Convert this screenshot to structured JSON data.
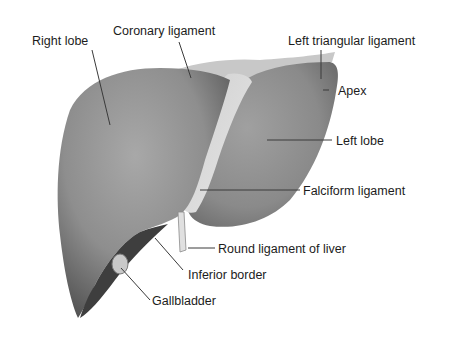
{
  "diagram": {
    "colors": {
      "background": "#ffffff",
      "organ_dark": "#6a6a6a",
      "organ_mid": "#8c8c8c",
      "organ_light": "#a9a9a9",
      "ligament": "#d8d8d8",
      "leader_line": "#3a3a3a",
      "text": "#1c1c1c"
    },
    "labels": [
      {
        "id": "right-lobe",
        "text": "Right lobe"
      },
      {
        "id": "coronary-ligament",
        "text": "Coronary ligament"
      },
      {
        "id": "left-triangular-ligament",
        "text": "Left triangular ligament"
      },
      {
        "id": "apex",
        "text": "Apex"
      },
      {
        "id": "left-lobe",
        "text": "Left lobe"
      },
      {
        "id": "falciform-ligament",
        "text": "Falciform ligament"
      },
      {
        "id": "round-ligament",
        "text": "Round ligament of liver"
      },
      {
        "id": "inferior-border",
        "text": "Inferior border"
      },
      {
        "id": "gallbladder",
        "text": "Gallbladder"
      }
    ]
  }
}
